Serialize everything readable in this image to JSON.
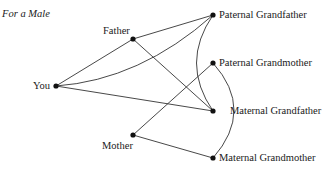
{
  "title": "For a Male",
  "nodes": [
    {
      "id": "you",
      "label": "You"
    },
    {
      "id": "father",
      "label": "Father"
    },
    {
      "id": "mother",
      "label": "Mother"
    },
    {
      "id": "pgf",
      "label": "Paternal Grandfather"
    },
    {
      "id": "pgm",
      "label": "Paternal Grandmother"
    },
    {
      "id": "mgf",
      "label": "Maternal Grandfather"
    },
    {
      "id": "mgm",
      "label": "Maternal Grandmother"
    }
  ],
  "edges": [
    [
      "you",
      "father"
    ],
    [
      "you",
      "pgf"
    ],
    [
      "you",
      "mgf"
    ],
    [
      "father",
      "pgf"
    ],
    [
      "father",
      "mgf"
    ],
    [
      "pgf",
      "mgf"
    ],
    [
      "pgm",
      "mgm"
    ],
    [
      "mother",
      "pgm"
    ],
    [
      "mother",
      "mgm"
    ]
  ]
}
